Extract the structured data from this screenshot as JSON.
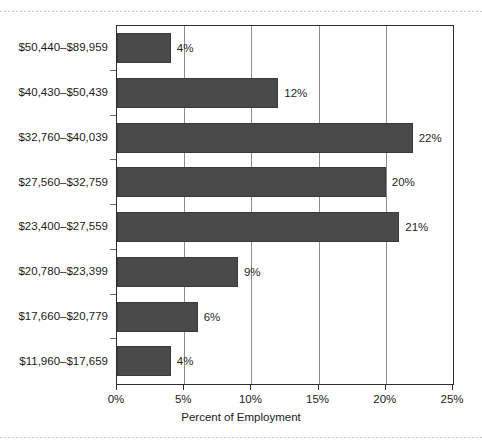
{
  "chart_data": {
    "type": "bar",
    "orientation": "horizontal",
    "title": "",
    "xlabel": "Percent of Employment",
    "ylabel": "",
    "categories": [
      "$50,440–$89,959",
      "$40,430–$50,439",
      "$32,760–$40,039",
      "$27,560–$32,759",
      "$23,400–$27,559",
      "$20,780–$23,399",
      "$17,660–$20,779",
      "$11,960–$17,659"
    ],
    "values": [
      4,
      12,
      22,
      20,
      21,
      9,
      6,
      4
    ],
    "value_labels": [
      "4%",
      "12%",
      "22%",
      "20%",
      "21%",
      "9%",
      "6%",
      "4%"
    ],
    "xlim": [
      0,
      25
    ],
    "xticks": [
      0,
      5,
      10,
      15,
      20,
      25
    ],
    "xtick_labels": [
      "0%",
      "5%",
      "10%",
      "15%",
      "20%",
      "25%"
    ],
    "grid": "vertical",
    "legend": "none",
    "bar_color": "#4a4a4a",
    "axis_color": "#2e2e2e",
    "gridline_color": "#8d8d8d",
    "background_color": "#ffffff"
  }
}
